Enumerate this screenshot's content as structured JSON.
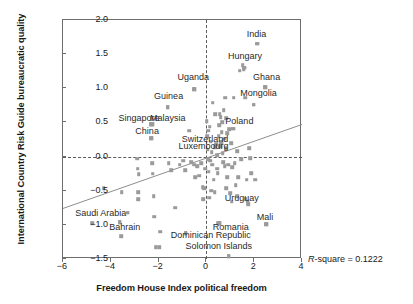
{
  "chart_data": {
    "type": "scatter",
    "title": "",
    "xlabel": "Freedom House Index political freedom",
    "ylabel": "International Country Risk Guide bureaucratic quality",
    "xlim": [
      -6,
      4
    ],
    "ylim": [
      -1.5,
      2.0
    ],
    "xticks": [
      "−6",
      "−4",
      "−2",
      "0",
      "2",
      "4"
    ],
    "xtick_values": [
      -6,
      -4,
      -2,
      0,
      2,
      4
    ],
    "yticks": [
      "2.0",
      "1.5",
      "1.0",
      "0.5",
      "0.0",
      "−0.5",
      "−1.0",
      "−1.5"
    ],
    "ytick_values": [
      2.0,
      1.5,
      1.0,
      0.5,
      0.0,
      -0.5,
      -1.0,
      -1.5
    ],
    "grid": false,
    "legend": "none",
    "annotation": "R-square = 0.1222",
    "annotation_r": "R",
    "annotation_rest": "-square = 0.1222",
    "marker_color": "#9a9a9a",
    "line_color": "#8e8e8e",
    "reference_lines": [
      {
        "axis": "x",
        "value": 0,
        "style": "dashed"
      },
      {
        "axis": "y",
        "value": 0,
        "style": "dashed"
      }
    ],
    "fit_line": {
      "x0": -6,
      "y0": -0.76,
      "x1": 4,
      "y1": 0.47
    },
    "labeled_points": [
      {
        "label": "India",
        "lx": 2.1,
        "ly": 1.8,
        "px": 2.12,
        "py": 1.65
      },
      {
        "label": "Hungary",
        "lx": 1.62,
        "ly": 1.47,
        "px": 1.58,
        "py": 1.3
      },
      {
        "label": "Ghana",
        "lx": 2.52,
        "ly": 1.17,
        "px": 2.46,
        "py": 1.02
      },
      {
        "label": "Mongolia",
        "lx": 2.18,
        "ly": 0.93,
        "px": 1.98,
        "py": 0.76
      },
      {
        "label": "Uganda",
        "lx": -0.55,
        "ly": 1.16,
        "px": -0.52,
        "py": 0.99
      },
      {
        "label": "Guinea",
        "lx": -1.58,
        "ly": 0.88,
        "px": -1.62,
        "py": 0.72
      },
      {
        "label": "Singapore",
        "lx": -2.82,
        "ly": 0.56,
        "px": -2.3,
        "py": 0.47
      },
      {
        "label": "Malaysia",
        "lx": -1.62,
        "ly": 0.56,
        "px": -2.26,
        "py": 0.47
      },
      {
        "label": "China",
        "lx": -2.48,
        "ly": 0.38,
        "px": -2.32,
        "py": 0.27
      },
      {
        "label": "Poland",
        "lx": 1.38,
        "ly": 0.52,
        "px": 1.12,
        "py": 0.41
      },
      {
        "label": "Switzerland",
        "lx": -0.06,
        "ly": 0.26,
        "px": 0.62,
        "py": 0.21
      },
      {
        "label": "Luxembourg",
        "lx": -0.12,
        "ly": 0.15,
        "px": 0.58,
        "py": 0.15
      },
      {
        "label": "Uruguay",
        "lx": 1.48,
        "ly": -0.6,
        "px": 1.72,
        "py": -0.66
      },
      {
        "label": "Mali",
        "lx": 2.45,
        "ly": -0.88,
        "px": 2.5,
        "py": -0.99
      },
      {
        "label": "Saudi Arabia",
        "lx": -4.42,
        "ly": -0.83,
        "px": -3.3,
        "py": -0.82
      },
      {
        "label": "Bahrain",
        "lx": -3.42,
        "ly": -1.03,
        "px": -3.62,
        "py": -0.96
      },
      {
        "label": "Romania",
        "lx": 1.02,
        "ly": -1.03,
        "px": 0.55,
        "py": -0.98
      },
      {
        "label": "Dominican Republic",
        "lx": 0.18,
        "ly": -1.15,
        "px": -0.86,
        "py": -1.12
      },
      {
        "label": "Solomon Islands",
        "lx": 0.52,
        "ly": -1.31,
        "px": 0.94,
        "py": -1.46
      }
    ],
    "points": [
      [
        -4.78,
        -0.98
      ],
      [
        -4.3,
        -0.46
      ],
      [
        -3.62,
        -0.96
      ],
      [
        -3.55,
        -0.52
      ],
      [
        -3.3,
        -0.82
      ],
      [
        -3.56,
        -1.17
      ],
      [
        -2.86,
        -0.52
      ],
      [
        -2.86,
        -0.62
      ],
      [
        -2.9,
        -0.03
      ],
      [
        -2.84,
        -0.26
      ],
      [
        -2.88,
        -0.18
      ],
      [
        -2.3,
        0.47
      ],
      [
        -2.26,
        0.47
      ],
      [
        -2.32,
        0.27
      ],
      [
        -2.28,
        -0.1
      ],
      [
        -2.24,
        -0.25
      ],
      [
        -2.2,
        -0.58
      ],
      [
        -2.18,
        -0.88
      ],
      [
        -2.12,
        -1.33
      ],
      [
        -1.98,
        -1.33
      ],
      [
        -1.94,
        -1.1
      ],
      [
        -1.62,
        0.72
      ],
      [
        -1.58,
        -0.1
      ],
      [
        -1.48,
        -0.2
      ],
      [
        -1.3,
        -0.75
      ],
      [
        -1.12,
        -0.12
      ],
      [
        -0.96,
        -0.06
      ],
      [
        -0.88,
        -0.2
      ],
      [
        -0.86,
        -1.12
      ],
      [
        -0.72,
        0.38
      ],
      [
        -0.64,
        -0.08
      ],
      [
        -0.52,
        0.99
      ],
      [
        -0.5,
        -0.12
      ],
      [
        -0.46,
        -0.3
      ],
      [
        -0.38,
        -0.14
      ],
      [
        -0.3,
        -0.28
      ],
      [
        -0.22,
        -0.1
      ],
      [
        -0.16,
        -0.45
      ],
      [
        -0.14,
        -0.62
      ],
      [
        -0.08,
        -0.46
      ],
      [
        -0.06,
        -0.18
      ],
      [
        0.02,
        0.52
      ],
      [
        0.04,
        0.3
      ],
      [
        0.06,
        0.1
      ],
      [
        0.08,
        -0.04
      ],
      [
        0.1,
        -0.22
      ],
      [
        0.12,
        -0.6
      ],
      [
        0.14,
        0.44
      ],
      [
        0.18,
        0.22
      ],
      [
        0.22,
        0.06
      ],
      [
        0.24,
        -0.12
      ],
      [
        0.26,
        0.79
      ],
      [
        0.3,
        -0.34
      ],
      [
        0.34,
        -0.52
      ],
      [
        0.38,
        0.62
      ],
      [
        0.4,
        0.18
      ],
      [
        0.44,
        0.02
      ],
      [
        0.46,
        -0.18
      ],
      [
        0.48,
        -0.24
      ],
      [
        0.5,
        -0.98
      ],
      [
        0.52,
        0.3
      ],
      [
        0.54,
        0.46
      ],
      [
        0.55,
        -0.98
      ],
      [
        0.58,
        0.15
      ],
      [
        0.6,
        0.58
      ],
      [
        0.62,
        0.21
      ],
      [
        0.64,
        0.36
      ],
      [
        0.66,
        0.5
      ],
      [
        0.68,
        0.05
      ],
      [
        0.7,
        -0.08
      ],
      [
        0.72,
        0.68
      ],
      [
        0.74,
        0.26
      ],
      [
        0.76,
        -0.14
      ],
      [
        0.78,
        0.86
      ],
      [
        0.8,
        0.12
      ],
      [
        0.82,
        -0.46
      ],
      [
        0.86,
        0.34
      ],
      [
        0.88,
        -0.3
      ],
      [
        0.9,
        -0.12
      ],
      [
        0.94,
        -1.46
      ],
      [
        0.96,
        0.4
      ],
      [
        1.0,
        -0.54
      ],
      [
        1.04,
        0.2
      ],
      [
        1.08,
        -0.16
      ],
      [
        1.12,
        0.41
      ],
      [
        1.14,
        0.86
      ],
      [
        1.18,
        -0.1
      ],
      [
        1.22,
        -0.42
      ],
      [
        1.28,
        0.08
      ],
      [
        1.34,
        -0.3
      ],
      [
        1.4,
        1.26
      ],
      [
        1.46,
        -0.04
      ],
      [
        1.52,
        1.34
      ],
      [
        1.56,
        1.28
      ],
      [
        1.58,
        1.3
      ],
      [
        1.62,
        0.86
      ],
      [
        1.64,
        -0.62
      ],
      [
        1.68,
        -0.34
      ],
      [
        1.72,
        -0.66
      ],
      [
        1.76,
        -0.7
      ],
      [
        1.8,
        0.12
      ],
      [
        1.84,
        -0.02
      ],
      [
        1.88,
        -0.24
      ],
      [
        1.98,
        0.76
      ],
      [
        2.04,
        -0.34
      ],
      [
        2.12,
        1.65
      ],
      [
        2.46,
        1.02
      ],
      [
        2.5,
        -0.99
      ],
      [
        0.08,
        0.38
      ],
      [
        0.16,
        -0.06
      ],
      [
        0.2,
        -0.5
      ],
      [
        0.36,
        0.14
      ],
      [
        0.56,
        0.62
      ],
      [
        0.84,
        0.56
      ],
      [
        1.06,
        -0.66
      ],
      [
        1.3,
        -0.58
      ]
    ]
  }
}
